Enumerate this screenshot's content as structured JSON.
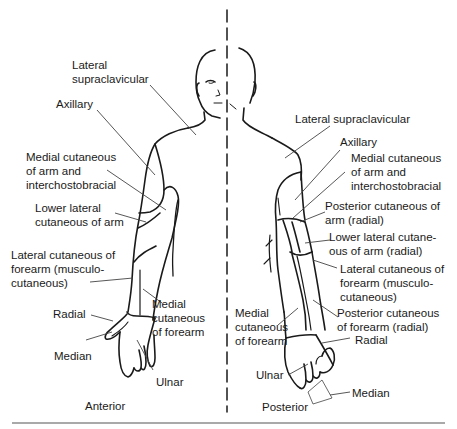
{
  "figure": {
    "views": {
      "anterior": "Anterior",
      "posterior": "Posterior"
    },
    "anterior_labels": [
      {
        "text": "Lateral\nsupraclavicular"
      },
      {
        "text": "Axillary"
      },
      {
        "text": "Medial cutaneous\nof arm and\ninterchostobracial"
      },
      {
        "text": "Lower lateral\ncutaneous of arm"
      },
      {
        "text": "Lateral cutaneous of\nforearm (musculo-\ncutaneous)"
      },
      {
        "text": "Medial\ncutaneous\nof forearm"
      },
      {
        "text": "Radial"
      },
      {
        "text": "Median"
      },
      {
        "text": "Ulnar"
      }
    ],
    "posterior_labels": [
      {
        "text": "Lateral supraclavicular"
      },
      {
        "text": "Axillary"
      },
      {
        "text": "Medial cutaneous\nof arm and\ninterchostobracial"
      },
      {
        "text": "Posterior cutaneous of\narm (radial)"
      },
      {
        "text": "Lower lateral cutane-\nous of arm (radial)"
      },
      {
        "text": "Lateral cutaneous of\nforearm (musculo-\ncutaneous)"
      },
      {
        "text": "Posterior cutaneous\nof forearm (radial)"
      },
      {
        "text": "Medial\ncutaneous\nof forearm"
      },
      {
        "text": "Radial"
      },
      {
        "text": "Ulnar"
      },
      {
        "text": "Median"
      }
    ],
    "colors": {
      "line": "#1a1a1a",
      "leader": "#444444",
      "background": "#ffffff"
    }
  }
}
